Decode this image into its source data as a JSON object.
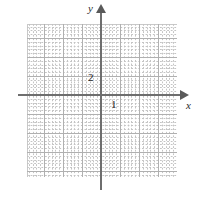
{
  "figure": {
    "name": "cartesian-coordinate-grid",
    "background_color": "#ffffff",
    "axis_color": "#6e6e6e",
    "major_grid_color": "#b0b0b0",
    "minor_grid_color": "#c4c4c4"
  },
  "axes": {
    "x_label": "x",
    "y_label": "y",
    "x_arrow": "arrow-right",
    "y_arrow": "arrow-up"
  },
  "tick_labels": {
    "y_two": "2",
    "x_one": "1"
  },
  "chart_data": {
    "type": "scatter",
    "title": "",
    "subtitle": "",
    "xlabel": "x",
    "ylabel": "y",
    "series": [
      {
        "name": "empty",
        "x": [],
        "y": []
      }
    ],
    "xlim": [
      -4,
      4
    ],
    "ylim": [
      -4,
      4
    ],
    "xticks": [
      1
    ],
    "yticks": [
      2
    ],
    "xticklabels": [
      "1"
    ],
    "yticklabels": [
      "2"
    ],
    "grid": true,
    "grid_style": "dotted-minor-with-solid-major",
    "major_grid_step": 1,
    "minor_grid_divisions": 5,
    "legend": null,
    "annotations": []
  }
}
